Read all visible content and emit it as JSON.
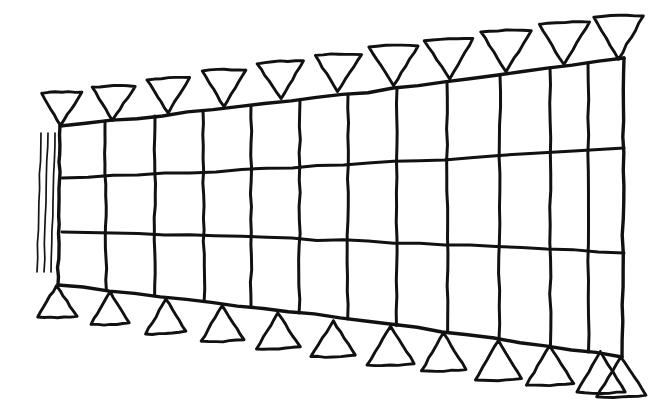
{
  "figure": {
    "domain": "Diagram",
    "kind": "hand-drawn structural engineering sketch",
    "canvas": {
      "width": 660,
      "height": 411,
      "background": "#ffffff"
    },
    "ink_color": "#111111",
    "line_weights": {
      "frame": 3.4,
      "grid": 3.0,
      "triangle": 2.9,
      "hatch": 1.7
    }
  },
  "geometry": {
    "description": "A long wedge/tapered rectangular grid, narrow at the left and tall at the right, drawn freehand. Horizontal chord lines run left to right; short vertical web lines divide it into bays. Downward-pointing triangles sit along the top chord and upward-pointing triangles sit below the bottom chord.",
    "top_chord": {
      "name": "top-chord",
      "left_point": [
        60,
        126
      ],
      "right_point": [
        624,
        58
      ],
      "sag": 3
    },
    "second_chord": {
      "name": "second-chord",
      "left_point": [
        62,
        178
      ],
      "right_point": [
        624,
        148
      ],
      "sag": 2
    },
    "third_chord": {
      "name": "third-chord",
      "left_point": [
        62,
        232
      ],
      "right_point": [
        624,
        253
      ],
      "sag": -2
    },
    "bottom_chord": {
      "name": "bottom-chord",
      "left_point": [
        58,
        285
      ],
      "right_point": [
        622,
        357
      ],
      "sag": -3
    },
    "left_edge": {
      "name": "left-edge-post",
      "top": [
        60,
        126
      ],
      "bottom": [
        58,
        285
      ]
    },
    "right_edge": {
      "name": "right-edge-post",
      "top": [
        624,
        58
      ],
      "bottom": [
        622,
        357
      ]
    },
    "vertical_web_x_positions": [
      105,
      155,
      203,
      251,
      300,
      348,
      397,
      447,
      500,
      550,
      588
    ],
    "hatch_lines": {
      "name": "left-hatch-marks",
      "count": 3,
      "x_positions": [
        38,
        45,
        52
      ],
      "top_y": 133,
      "bottom_y": 272,
      "bow": 7
    }
  },
  "chart_data": {
    "type": "line",
    "xlabel": "",
    "ylabel": "",
    "series": [
      {
        "name": "top chord",
        "x": [
          60,
          624
        ],
        "y": [
          126,
          58
        ]
      },
      {
        "name": "second chord",
        "x": [
          62,
          624
        ],
        "y": [
          178,
          148
        ]
      },
      {
        "name": "third chord",
        "x": [
          62,
          624
        ],
        "y": [
          232,
          253
        ]
      },
      {
        "name": "bottom chord",
        "x": [
          58,
          624
        ],
        "y": [
          285,
          357
        ]
      }
    ],
    "counts": {
      "horizontal_chords": 4,
      "vertical_webs": 13,
      "top_triangles": 11,
      "bottom_triangles": 13,
      "hatch_marks": 3
    }
  },
  "top_triangles": {
    "name": "top-support-triangles",
    "orientation": "apex-down",
    "items": [
      {
        "apex": [
          61,
          126
        ],
        "half_width": 20,
        "height": 32
      },
      {
        "apex": [
          113,
          120
        ],
        "half_width": 21,
        "height": 33
      },
      {
        "apex": [
          168,
          113
        ],
        "half_width": 22,
        "height": 34
      },
      {
        "apex": [
          224,
          106
        ],
        "half_width": 22,
        "height": 35
      },
      {
        "apex": [
          281,
          99
        ],
        "half_width": 23,
        "height": 36
      },
      {
        "apex": [
          338,
          92
        ],
        "half_width": 23,
        "height": 37
      },
      {
        "apex": [
          394,
          85
        ],
        "half_width": 24,
        "height": 38
      },
      {
        "apex": [
          449,
          79
        ],
        "half_width": 24,
        "height": 39
      },
      {
        "apex": [
          506,
          72
        ],
        "half_width": 25,
        "height": 40
      },
      {
        "apex": [
          564,
          65
        ],
        "half_width": 25,
        "height": 41
      },
      {
        "apex": [
          619,
          59
        ],
        "half_width": 25,
        "height": 41
      }
    ]
  },
  "bottom_triangles": {
    "name": "bottom-support-triangles",
    "orientation": "apex-up",
    "items": [
      {
        "apex": [
          57,
          286
        ],
        "half_width": 19,
        "height": 32
      },
      {
        "apex": [
          110,
          292
        ],
        "half_width": 20,
        "height": 33
      },
      {
        "apex": [
          166,
          299
        ],
        "half_width": 21,
        "height": 34
      },
      {
        "apex": [
          222,
          306
        ],
        "half_width": 21,
        "height": 35
      },
      {
        "apex": [
          278,
          313
        ],
        "half_width": 22,
        "height": 36
      },
      {
        "apex": [
          334,
          320
        ],
        "half_width": 22,
        "height": 37
      },
      {
        "apex": [
          390,
          327
        ],
        "half_width": 23,
        "height": 38
      },
      {
        "apex": [
          444,
          333
        ],
        "half_width": 23,
        "height": 38
      },
      {
        "apex": [
          498,
          340
        ],
        "half_width": 23,
        "height": 39
      },
      {
        "apex": [
          550,
          346
        ],
        "half_width": 24,
        "height": 39
      },
      {
        "apex": [
          600,
          352
        ],
        "half_width": 24,
        "height": 40
      },
      {
        "apex": [
          621,
          357
        ],
        "half_width": 24,
        "height": 40
      }
    ]
  }
}
